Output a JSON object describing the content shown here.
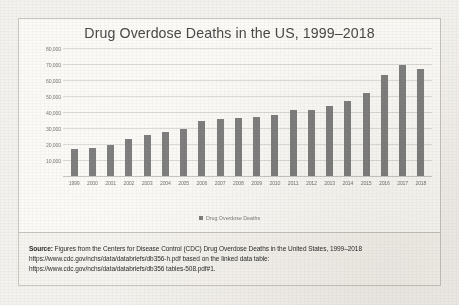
{
  "chart_data": {
    "type": "bar",
    "title": "Drug Overdose Deaths in the US, 1999–2018",
    "xlabel": "",
    "ylabel": "",
    "grid": true,
    "legend_position": "bottom",
    "legend": [
      "Drug Overdose Deaths"
    ],
    "ylim": [
      0,
      80000
    ],
    "yticks": [
      10000,
      20000,
      30000,
      40000,
      50000,
      60000,
      70000,
      80000
    ],
    "ytick_labels": [
      "10,000",
      "20,000",
      "30,000",
      "40,000",
      "50,000",
      "60,000",
      "70,000",
      "80,000"
    ],
    "categories": [
      "1999",
      "2000",
      "2001",
      "2002",
      "2003",
      "2004",
      "2005",
      "2006",
      "2007",
      "2008",
      "2009",
      "2010",
      "2011",
      "2012",
      "2013",
      "2014",
      "2015",
      "2016",
      "2017",
      "2018"
    ],
    "series": [
      {
        "name": "Drug Overdose Deaths",
        "color": "#7f7f7f",
        "values": [
          16849,
          17415,
          19394,
          23518,
          25785,
          27424,
          29813,
          34425,
          36010,
          36450,
          37004,
          38329,
          41340,
          41502,
          43982,
          47055,
          52404,
          63632,
          70237,
          67367
        ]
      }
    ]
  },
  "chart": {
    "title": "Drug Overdose Deaths in the US, 1999–2018",
    "legend_label": "Drug Overdose Deaths"
  },
  "source": {
    "line1_prefix": "Source:",
    "line1": " Figures from the Centers for Disease Control (CDC) Drug Overdose Deaths in the United States, 1999–2018",
    "line2": "https://www.cdc.gov/nchs/data/databriefs/db356-h.pdf based on the linked data table:",
    "line3": "https://www.cdc.gov/nchs/data/databriefs/db356  tables-508.pdf#1."
  }
}
